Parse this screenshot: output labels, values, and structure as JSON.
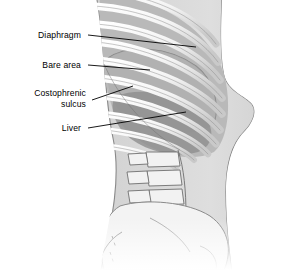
{
  "figure": {
    "background_color": "#ffffff",
    "width": 286,
    "height": 270
  },
  "labels": [
    {
      "id": "diaphragm",
      "text": "Diaphragm",
      "leader_from": [
        88,
        35
      ],
      "leader_to": [
        196,
        47
      ]
    },
    {
      "id": "bare_area",
      "text": "Bare area",
      "leader_from": [
        88,
        65
      ],
      "leader_to": [
        150,
        70
      ]
    },
    {
      "id": "costophrenic",
      "text": "Costophrenic\nsulcus",
      "leader_from": [
        92,
        100
      ],
      "leader_to": [
        133,
        86
      ]
    },
    {
      "id": "liver",
      "text": "Liver",
      "leader_from": [
        88,
        128
      ],
      "leader_to": [
        186,
        112
      ]
    }
  ],
  "anatomy": {
    "parts": [
      {
        "name": "rib",
        "count": 10,
        "color": "#f4f4f4",
        "outline": "#8d8d8d"
      },
      {
        "name": "intercostal-space",
        "color": "#c2c2c2"
      },
      {
        "name": "diaphragm-dome",
        "color": "#b4b4b4"
      },
      {
        "name": "liver",
        "color": "#9b9b9b"
      },
      {
        "name": "body-outline",
        "color": "#dcdcdc",
        "outline": "#8a8a8a"
      },
      {
        "name": "lumbar-vertebra",
        "count": 4,
        "color": "#f2f2f2",
        "outline": "#6f6f6f"
      },
      {
        "name": "pelvis-ilium",
        "color": "#f3f3f3",
        "outline": "#8a8a8a"
      },
      {
        "name": "sacrum",
        "color": "#eeeeee",
        "outline": "#8a8a8a"
      }
    ],
    "palette": {
      "bone_light": "#f4f4f4",
      "bone_shadow": "#c2c2c2",
      "soft_tissue": "#dcdcdc",
      "organ_dark": "#9b9b9b",
      "line": "#000000"
    }
  }
}
